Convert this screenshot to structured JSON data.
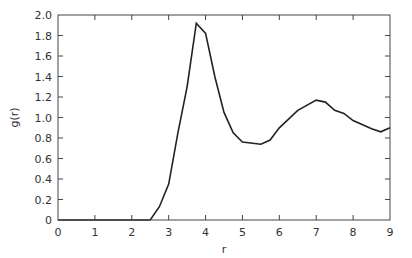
{
  "chart_data": {
    "type": "line",
    "title": "",
    "xlabel": "r",
    "ylabel": "g(r)",
    "xlim": [
      0,
      9
    ],
    "ylim": [
      0,
      2.0
    ],
    "grid": false,
    "legend": null,
    "x_ticks": [
      "0",
      "1",
      "2",
      "3",
      "4",
      "5",
      "6",
      "7",
      "8",
      "9"
    ],
    "y_ticks": [
      "0",
      "0.2",
      "0.4",
      "0.6",
      "0.8",
      "1.0",
      "1.2",
      "1.4",
      "1.6",
      "1.8",
      "2.0"
    ],
    "series": [
      {
        "name": "g(r)",
        "color": "#222222",
        "x": [
          0,
          2.5,
          2.75,
          3.0,
          3.25,
          3.5,
          3.75,
          4.0,
          4.25,
          4.5,
          4.75,
          5.0,
          5.5,
          5.75,
          6.0,
          6.5,
          7.0,
          7.25,
          7.5,
          7.75,
          8.0,
          8.5,
          8.75,
          9.0
        ],
        "values": [
          0,
          0,
          0.13,
          0.35,
          0.85,
          1.3,
          1.92,
          1.82,
          1.4,
          1.05,
          0.85,
          0.76,
          0.74,
          0.78,
          0.9,
          1.07,
          1.17,
          1.15,
          1.07,
          1.04,
          0.97,
          0.89,
          0.86,
          0.9
        ]
      }
    ]
  }
}
